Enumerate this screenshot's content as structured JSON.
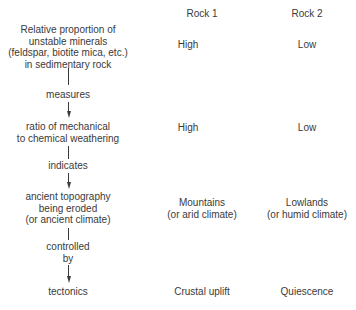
{
  "columns": {
    "rock1_header": "Rock 1",
    "rock2_header": "Rock 2"
  },
  "flow": {
    "node1": {
      "lines": [
        "Relative proportion of",
        "unstable minerals",
        "(feldspar, biotite mica, etc.)",
        "in sedimentary rock"
      ],
      "rock1": "High",
      "rock2": "Low"
    },
    "link1": {
      "label": "measures"
    },
    "node2": {
      "lines": [
        "ratio of mechanical",
        "to chemical weathering"
      ],
      "rock1": "High",
      "rock2": "Low"
    },
    "link2": {
      "label": "indicates"
    },
    "node3": {
      "lines": [
        "ancient topography",
        "being eroded",
        "(or ancient climate)"
      ],
      "rock1": [
        "Mountains",
        "(or arid climate)"
      ],
      "rock2": [
        "Lowlands",
        "(or humid climate)"
      ]
    },
    "link3": {
      "label_lines": [
        "controlled",
        "by"
      ]
    },
    "node4": {
      "lines": [
        "tectonics"
      ],
      "rock1": "Crustal uplift",
      "rock2": "Quiescence"
    }
  },
  "colors": {
    "text": "#3a3a3a",
    "background": "#ffffff"
  }
}
